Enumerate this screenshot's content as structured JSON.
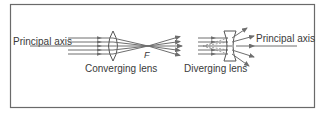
{
  "figure": {
    "labels": {
      "principal_axis_left": "Principal axis",
      "principal_axis_right": "Principal axis",
      "converging_lens": "Converging lens",
      "focus": "F",
      "diverging_lens": "Diverging lens"
    },
    "colors": {
      "frame": "#6a6a6a",
      "rays": "#6e6e6e",
      "lens": "#555555",
      "text": "#3a3a3a",
      "background": "#ffffff"
    },
    "ray_count": 5
  }
}
